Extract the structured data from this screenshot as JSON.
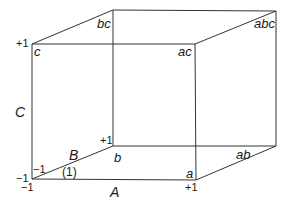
{
  "diagram": {
    "type": "factorial-design-cube",
    "line_color": "#333333",
    "vertices": {
      "origin": "(1)",
      "a": "a",
      "b": "b",
      "ab": "ab",
      "c": "c",
      "ac": "ac",
      "bc": "bc",
      "abc": "abc"
    },
    "axes": {
      "A": {
        "label": "A",
        "low": "−1",
        "high": "+1"
      },
      "B": {
        "label": "B",
        "low": "−1",
        "high": "+1"
      },
      "C": {
        "label": "C",
        "low": "−1",
        "high": "+1"
      }
    }
  }
}
